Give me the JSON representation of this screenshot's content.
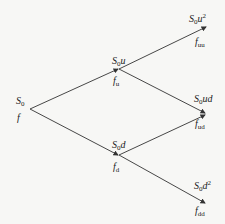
{
  "diagram": {
    "type": "binomial-tree",
    "nodes": [
      {
        "id": "root",
        "price": "S0",
        "price_base": "S",
        "price_sub": "0",
        "price_rest": "",
        "price_sup": "",
        "value_base": "f",
        "value_sub": ""
      },
      {
        "id": "u",
        "price_base": "S",
        "price_sub": "0",
        "price_rest": "u",
        "price_sup": "",
        "value_base": "f",
        "value_sub": "u"
      },
      {
        "id": "d",
        "price_base": "S",
        "price_sub": "0",
        "price_rest": "d",
        "price_sup": "",
        "value_base": "f",
        "value_sub": "d"
      },
      {
        "id": "uu",
        "price_base": "S",
        "price_sub": "0",
        "price_rest": "u",
        "price_sup": "2",
        "value_base": "f",
        "value_sub": "uu"
      },
      {
        "id": "ud",
        "price_base": "S",
        "price_sub": "0",
        "price_rest": "ud",
        "price_sup": "",
        "value_base": "f",
        "value_sub": "ud"
      },
      {
        "id": "dd",
        "price_base": "S",
        "price_sub": "0",
        "price_rest": "d",
        "price_sup": "2",
        "value_base": "f",
        "value_sub": "dd"
      }
    ],
    "edges": [
      {
        "from": "root",
        "to": "u"
      },
      {
        "from": "root",
        "to": "d"
      },
      {
        "from": "u",
        "to": "uu"
      },
      {
        "from": "u",
        "to": "ud"
      },
      {
        "from": "d",
        "to": "ud"
      },
      {
        "from": "d",
        "to": "dd"
      }
    ],
    "colors": {
      "line": "#333333",
      "text": "#222222",
      "background": "#f7f7f5"
    }
  }
}
